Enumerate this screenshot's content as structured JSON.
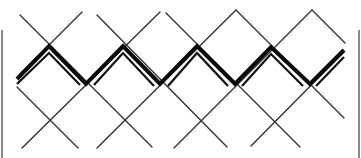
{
  "figure": {
    "width": 361,
    "height": 158,
    "colors": {
      "background": "#ffffff",
      "lattice": "#333333",
      "zigzag": "#0a0a0a",
      "border": "#8a8a8a"
    },
    "borders": [
      {
        "x": 2,
        "y1": 30,
        "y2": 158
      },
      {
        "x": 359,
        "y1": 30,
        "y2": 158
      }
    ],
    "lattice_lines": [
      {
        "x1": 20,
        "y1": 15,
        "x2": 152,
        "y2": 147
      },
      {
        "x1": 97,
        "y1": 15,
        "x2": 227,
        "y2": 147
      },
      {
        "x1": 166,
        "y1": 13,
        "x2": 300,
        "y2": 147
      },
      {
        "x1": 236,
        "y1": 10,
        "x2": 344,
        "y2": 118
      },
      {
        "x1": 312,
        "y1": 10,
        "x2": 345,
        "y2": 43
      },
      {
        "x1": 17,
        "y1": 87,
        "x2": 78,
        "y2": 148
      },
      {
        "x1": 82,
        "y1": 12,
        "x2": 20,
        "y2": 74
      },
      {
        "x1": 160,
        "y1": 12,
        "x2": 22,
        "y2": 148
      },
      {
        "x1": 236,
        "y1": 10,
        "x2": 97,
        "y2": 148
      },
      {
        "x1": 312,
        "y1": 10,
        "x2": 174,
        "y2": 148
      },
      {
        "x1": 344,
        "y1": 52,
        "x2": 251,
        "y2": 146
      }
    ],
    "zigzag_thick": [
      [
        17,
        79
      ],
      [
        49,
        46
      ],
      [
        86,
        84
      ],
      [
        123,
        46
      ],
      [
        160,
        84
      ],
      [
        197,
        46
      ],
      [
        235,
        84
      ],
      [
        271,
        47
      ],
      [
        310,
        84
      ],
      [
        344,
        50
      ]
    ],
    "zigzag_thin": [
      [
        17,
        84
      ],
      [
        49,
        53
      ],
      [
        80,
        85
      ],
      [
        94,
        85
      ],
      [
        123,
        53
      ],
      [
        154,
        86
      ],
      [
        168,
        86
      ],
      [
        197,
        53
      ],
      [
        228,
        86
      ],
      [
        242,
        86
      ],
      [
        271,
        54
      ],
      [
        303,
        86
      ],
      [
        316,
        86
      ],
      [
        344,
        57
      ]
    ]
  }
}
